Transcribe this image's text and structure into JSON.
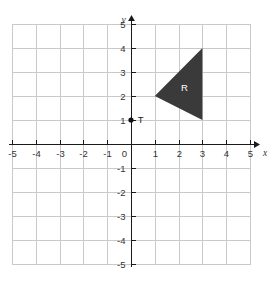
{
  "chart_data": {
    "type": "scatter",
    "title": "",
    "xlabel": "x",
    "ylabel": "y",
    "xlim": [
      -5,
      5
    ],
    "ylim": [
      -5,
      5
    ],
    "grid": true,
    "grid_step": 1,
    "legend": "none",
    "x_ticks": [
      -5,
      -4,
      -3,
      -2,
      -1,
      0,
      1,
      2,
      3,
      4,
      5
    ],
    "y_ticks": [
      -5,
      -4,
      -3,
      -2,
      -1,
      0,
      1,
      2,
      3,
      4,
      5
    ],
    "x_tick_labels": [
      "-5",
      "-4",
      "-3",
      "-2",
      "-1",
      "0",
      "1",
      "2",
      "3",
      "4",
      "5"
    ],
    "y_tick_labels": [
      "-5",
      "-4",
      "-3",
      "-2",
      "-1",
      "0",
      "1",
      "2",
      "3",
      "4",
      "5"
    ],
    "origin_label": "0",
    "shapes": [
      {
        "name": "R",
        "kind": "triangle",
        "vertices": [
          [
            1,
            2
          ],
          [
            3,
            4
          ],
          [
            3,
            1
          ]
        ],
        "fill": "#3a3a3a",
        "label": "R",
        "label_position": [
          2.25,
          2.2
        ],
        "label_color": "#ffffff"
      }
    ],
    "points": [
      {
        "name": "T",
        "label": "T",
        "coordinates": [
          0,
          1
        ],
        "color": "#111111",
        "label_offset": [
          0.28,
          0.0
        ]
      }
    ],
    "axis_labels": {
      "x": "x",
      "y": "y"
    },
    "colors": {
      "background": "#ffffff",
      "grid_line": "#c9c9c9",
      "axis": "#1a1a1a",
      "tick_text": "#333333",
      "shape_fill": "#3a3a3a",
      "point": "#111111"
    }
  }
}
